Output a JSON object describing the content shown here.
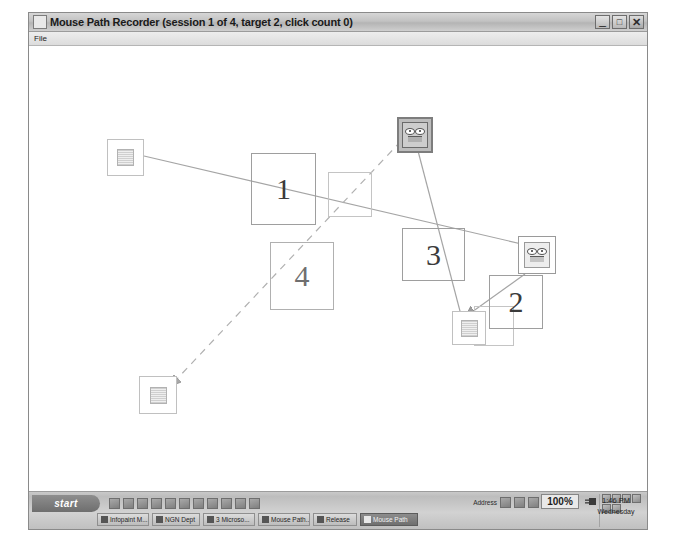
{
  "window": {
    "title": "Mouse Path Recorder (session 1 of 4, target 2, click count 0)",
    "menu": {
      "file": "File"
    },
    "controls": {
      "minimize": "_",
      "maximize": "□",
      "close": "✕"
    }
  },
  "canvas": {
    "numbered_boxes": [
      {
        "label": "1",
        "x": 222,
        "y": 107,
        "w": 65,
        "h": 72,
        "font": 30,
        "dark": true
      },
      {
        "label": "4",
        "x": 241,
        "y": 196,
        "w": 64,
        "h": 68,
        "font": 30,
        "dark": false
      },
      {
        "label": "3",
        "x": 373,
        "y": 182,
        "w": 63,
        "h": 53,
        "font": 30,
        "dark": true
      },
      {
        "label": "2",
        "x": 460,
        "y": 229,
        "w": 54,
        "h": 54,
        "font": 30,
        "dark": true
      }
    ],
    "empty_boxes": [
      {
        "x": 299,
        "y": 126,
        "w": 44,
        "h": 45
      },
      {
        "x": 445,
        "y": 260,
        "w": 40,
        "h": 40
      }
    ],
    "targets": [
      {
        "name": "target-idle-top-left",
        "state": "idle",
        "x": 78,
        "y": 93,
        "w": 37,
        "h": 37
      },
      {
        "name": "target-idle-bottom-left",
        "state": "idle",
        "x": 110,
        "y": 330,
        "w": 38,
        "h": 38
      },
      {
        "name": "target-idle-center",
        "state": "idle",
        "x": 423,
        "y": 265,
        "w": 34,
        "h": 34
      },
      {
        "name": "target-active-top",
        "state": "active",
        "x": 368,
        "y": 71,
        "w": 36,
        "h": 36
      },
      {
        "name": "target-active-right",
        "state": "half",
        "x": 489,
        "y": 190,
        "w": 38,
        "h": 38
      }
    ],
    "paths": [
      {
        "name": "solid-path-left-to-right",
        "style": "solid",
        "d": "M 115 110 L 510 202",
        "arrow": true
      },
      {
        "name": "dashed-path-top-to-bottom-left",
        "style": "dashed",
        "d": "M 372 95 L 147 334",
        "arrow": true
      },
      {
        "name": "solid-path-bottom-to-top",
        "style": "solid",
        "d": "M 437 288 L 383 82",
        "arrow": true
      },
      {
        "name": "solid-path-right-to-center",
        "style": "solid",
        "d": "M 496 228 L 443 266",
        "arrow": true
      }
    ]
  },
  "taskbar": {
    "start": "start",
    "buttons": [
      {
        "label": "Infopaint M..."
      },
      {
        "label": "NGN Dept"
      },
      {
        "label": "3 Microso..."
      },
      {
        "label": "Mouse Path..."
      },
      {
        "label": "Release"
      },
      {
        "label": "Mouse Path",
        "active": true
      }
    ],
    "tray_text": "Address",
    "zoom": "100%",
    "clock": {
      "time": "1:46 PM",
      "day": "Wednesday"
    }
  }
}
